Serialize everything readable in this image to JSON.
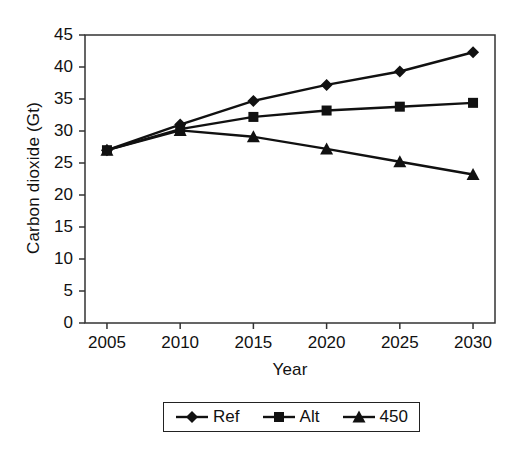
{
  "chart_data": {
    "type": "line",
    "title": "",
    "xlabel": "Year",
    "ylabel": "Carbon dioxide (Gt)",
    "x": [
      2005,
      2010,
      2015,
      2020,
      2025,
      2030
    ],
    "xtick_labels": [
      "2005",
      "2010",
      "2015",
      "2020",
      "2025",
      "2030"
    ],
    "ytick_labels": [
      "0",
      "5",
      "10",
      "15",
      "20",
      "25",
      "30",
      "35",
      "40",
      "45"
    ],
    "ytick_values": [
      0,
      5,
      10,
      15,
      20,
      25,
      30,
      35,
      40,
      45
    ],
    "xlim": [
      2003.5,
      2031.5
    ],
    "ylim": [
      0,
      45
    ],
    "grid": false,
    "legend_position": "below-center",
    "series": [
      {
        "name": "Ref",
        "marker": "diamond",
        "color": "#111111",
        "values": [
          27.0,
          31.0,
          34.7,
          37.2,
          39.3,
          42.3
        ]
      },
      {
        "name": "Alt",
        "marker": "square",
        "color": "#111111",
        "values": [
          27.0,
          30.3,
          32.2,
          33.2,
          33.8,
          34.4
        ]
      },
      {
        "name": "450",
        "marker": "triangle",
        "color": "#111111",
        "values": [
          27.0,
          30.1,
          29.1,
          27.2,
          25.2,
          23.2
        ]
      }
    ]
  },
  "legend": {
    "entries": [
      {
        "label": "Ref",
        "marker": "diamond"
      },
      {
        "label": "Alt",
        "marker": "square"
      },
      {
        "label": "450",
        "marker": "triangle"
      }
    ]
  }
}
